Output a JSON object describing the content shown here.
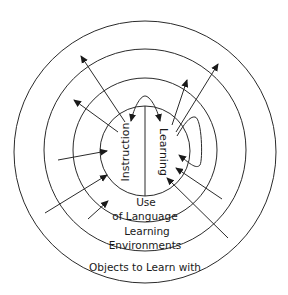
{
  "diagram": {
    "core": {
      "left_label": "Instruction",
      "right_label": "Learning"
    },
    "rings": [
      {
        "id": "use-of-language",
        "label_line1": "Use",
        "label_line2": "of Language"
      },
      {
        "id": "learning-environments",
        "label_line1": "Learning",
        "label_line2": "Environments"
      },
      {
        "id": "objects-to-learn-with",
        "label": "Objects to Learn with"
      }
    ],
    "colors": {
      "stroke": "#2b2b2b",
      "text": "#1a1a1a",
      "background": "#ffffff"
    }
  }
}
